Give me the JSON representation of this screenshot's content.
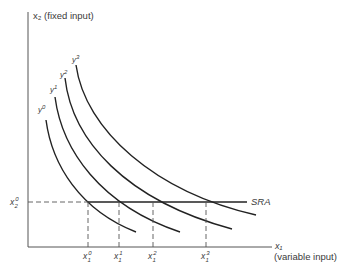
{
  "diagram": {
    "type": "isoquant-map",
    "y_axis_label": "x₂ (fixed input)",
    "x_axis_label_var": "x₁",
    "x_axis_label_desc": "(variable input)",
    "fixed_level_label": {
      "base": "x",
      "sup": "0",
      "sub": "2"
    },
    "line_label": "SRA",
    "curves": [
      {
        "label_base": "y",
        "label_sup": "0"
      },
      {
        "label_base": "y",
        "label_sup": "1"
      },
      {
        "label_base": "y",
        "label_sup": "2"
      },
      {
        "label_base": "y",
        "label_sup": "3"
      }
    ],
    "x_ticks": [
      {
        "base": "x",
        "sup": "0",
        "sub": "1"
      },
      {
        "base": "x",
        "sup": "1",
        "sub": "1"
      },
      {
        "base": "x",
        "sup": "2",
        "sub": "1"
      },
      {
        "base": "x",
        "sup": "3",
        "sub": "1"
      }
    ],
    "colors": {
      "line": "#222222",
      "text": "#3a3a3a",
      "dash": "#555555"
    }
  }
}
